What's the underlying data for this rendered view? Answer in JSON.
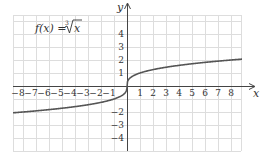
{
  "chart_data": {
    "type": "line",
    "title_parts": {
      "lhs": "f(x) = ",
      "index": "3",
      "radicand": "x"
    },
    "xlabel": "x",
    "ylabel": "y",
    "xlim": [
      -8.9,
      8.9
    ],
    "ylim": [
      -5,
      5
    ],
    "grid": true,
    "x_ticks": [
      -8,
      -7,
      -6,
      -5,
      -4,
      -3,
      -2,
      -1,
      1,
      2,
      3,
      4,
      5,
      6,
      7,
      8
    ],
    "x_tick_labels": [
      "−8",
      "−7",
      "−6",
      "−5",
      "−4",
      "−3",
      "−2",
      "−1",
      "1",
      "2",
      "3",
      "4",
      "5",
      "6",
      "7",
      "8"
    ],
    "y_ticks": [
      4,
      3,
      2,
      1,
      -2,
      -3,
      -4
    ],
    "y_tick_labels": [
      "4",
      "3",
      "2",
      "1",
      "−2",
      "−3",
      "−4"
    ],
    "series": [
      {
        "name": "f(x) = cube root of x",
        "x": [
          -8.8,
          -8,
          -6,
          -4,
          -2,
          -1,
          -0.5,
          -0.1,
          0,
          0.1,
          0.5,
          1,
          2,
          4,
          6,
          8,
          8.8
        ],
        "y": [
          -2.06,
          -2,
          -1.82,
          -1.59,
          -1.26,
          -1,
          -0.79,
          -0.46,
          0,
          0.46,
          0.79,
          1,
          1.26,
          1.59,
          1.82,
          2,
          2.06
        ]
      }
    ],
    "colors": {
      "curve": "#555555",
      "axis": "#444444",
      "grid": "#dddddd"
    }
  }
}
